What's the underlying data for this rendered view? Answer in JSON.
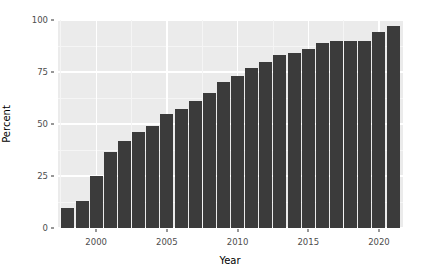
{
  "chart_data": {
    "type": "bar",
    "title": "",
    "subtitle": "",
    "xlabel": "Year",
    "ylabel": "Percent",
    "xlim": [
      1997.3,
      2021.7
    ],
    "ylim": [
      0,
      100
    ],
    "xticks": [
      2000,
      2005,
      2010,
      2015,
      2020
    ],
    "xtick_labels": [
      "2000",
      "2005",
      "2010",
      "2015",
      "2020"
    ],
    "yticks": [
      0,
      25,
      50,
      75,
      100
    ],
    "ytick_labels": [
      "0",
      "25",
      "50",
      "75",
      "100"
    ],
    "grid": true,
    "grid_major_color": "#FFFFFF",
    "grid_minor_color": "#F5F5F5",
    "panel_background": "#EBEBEB",
    "bar_color": "#3B3B3B",
    "legend": null,
    "legend_position": "none",
    "categories": [
      1998,
      1999,
      2000,
      2001,
      2002,
      2003,
      2004,
      2005,
      2006,
      2007,
      2008,
      2009,
      2010,
      2011,
      2012,
      2013,
      2014,
      2015,
      2016,
      2017,
      2018,
      2019,
      2020,
      2021
    ],
    "values": [
      9.5,
      13,
      25,
      36.5,
      42,
      46,
      49,
      55,
      57,
      61,
      65,
      70,
      73,
      77,
      80,
      83,
      84,
      86,
      89,
      90,
      90,
      90,
      94,
      97
    ],
    "series": [
      {
        "name": "Percent",
        "values": [
          9.5,
          13,
          25,
          36.5,
          42,
          46,
          49,
          55,
          57,
          61,
          65,
          70,
          73,
          77,
          80,
          83,
          84,
          86,
          89,
          90,
          90,
          90,
          94,
          97
        ]
      }
    ]
  },
  "axes": {
    "y_label": "Percent",
    "x_label": "Year",
    "y_ticks": [
      "0",
      "25",
      "50",
      "75",
      "100"
    ],
    "x_ticks": [
      "2000",
      "2005",
      "2010",
      "2015",
      "2020"
    ]
  }
}
